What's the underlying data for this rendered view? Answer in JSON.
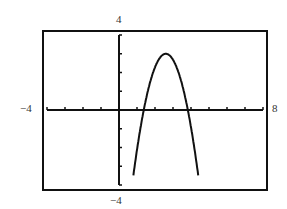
{
  "chart_data": {
    "type": "line",
    "title": "",
    "xlabel": "",
    "ylabel": "",
    "xlim": [
      -4,
      8
    ],
    "ylim": [
      -4,
      4
    ],
    "xscale_ticks": 1,
    "yscale_ticks": 1,
    "grid": false,
    "legend": null,
    "window_labels": {
      "xmin": "−4",
      "xmax": "8",
      "ymin": "−4",
      "ymax": "4"
    },
    "series": [
      {
        "name": "parabola",
        "description": "Downward-opening parabola, vertex near (2.6, 3), x-intercepts near 1.4 and 3.8",
        "equation_estimate": "y = -2(x - 2.6)^2 + 3",
        "x": [
          0.8,
          1.0,
          1.2,
          1.4,
          1.6,
          1.8,
          2.0,
          2.2,
          2.4,
          2.6,
          2.8,
          3.0,
          3.2,
          3.4,
          3.6,
          3.8,
          4.0,
          4.2,
          4.4
        ],
        "y": [
          -3.48,
          -2.12,
          -0.92,
          0.12,
          0.99,
          1.72,
          2.28,
          2.68,
          2.92,
          3.0,
          2.92,
          2.68,
          2.28,
          1.72,
          0.99,
          0.12,
          -0.92,
          -2.12,
          -3.48
        ]
      }
    ],
    "key_points": {
      "vertex": [
        2.6,
        3.0
      ],
      "x_intercepts": [
        1.38,
        3.82
      ]
    }
  },
  "style": {
    "line_color": "#111111",
    "axis_color": "#111111",
    "frame_color": "#111111",
    "background": "#ffffff"
  }
}
